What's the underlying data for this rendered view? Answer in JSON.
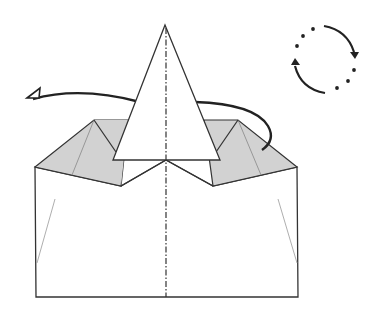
{
  "diagram": {
    "type": "origami-fold-step",
    "colors": {
      "line": "#333333",
      "shaded_flap": "#d2d2d2",
      "paper": "#ffffff",
      "arrow": "#222222",
      "thin_line": "#888888"
    },
    "symbols": {
      "turn_over_arrow": "curved-arrow-around-model",
      "rotate_icon": "circular-rotate-symbol"
    }
  }
}
